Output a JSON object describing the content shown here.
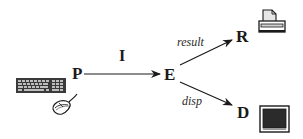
{
  "diagram": {
    "nodes": [
      {
        "id": "P",
        "label": "P",
        "devices": [
          "keyboard",
          "mouse"
        ]
      },
      {
        "id": "E",
        "label": "E"
      },
      {
        "id": "R",
        "label": "R",
        "devices": [
          "printer"
        ]
      },
      {
        "id": "D",
        "label": "D",
        "devices": [
          "monitor"
        ]
      }
    ],
    "edges": [
      {
        "from": "P",
        "to": "E",
        "label": "I"
      },
      {
        "from": "E",
        "to": "R",
        "label": "result"
      },
      {
        "from": "E",
        "to": "D",
        "label": "disp"
      }
    ]
  },
  "labels": {
    "P": "P",
    "E": "E",
    "R": "R",
    "D": "D",
    "edge_PE": "I",
    "edge_ER": "result",
    "edge_ED": "disp"
  },
  "icons": {
    "keyboard": "keyboard-icon",
    "mouse": "mouse-icon",
    "printer": "printer-icon",
    "monitor": "monitor-icon"
  },
  "colors": {
    "ink": "#1a1a1a",
    "screen": "#2b2b2b",
    "paper": "#e6e6e6",
    "background": "#ffffff"
  }
}
